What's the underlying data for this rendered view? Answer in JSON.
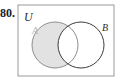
{
  "figure": {
    "problem_number": "80.",
    "type": "venn-diagram",
    "universe_label": "U",
    "set_a_label": "A",
    "set_b_label": "B",
    "shaded_region": "A minus B",
    "colors": {
      "shading_fill": "#e2e2e2",
      "circle_a_stroke": "#8c8c8c",
      "circle_b_stroke": "#3d3d3d",
      "rect_stroke": "#9a9a9a",
      "label_u_color": "#2b2b2b",
      "label_a_color": "#b5b5b5",
      "label_b_color": "#2b2b2b",
      "number_color": "#1a1a1a",
      "background": "#ffffff"
    },
    "geometry": {
      "rect": {
        "x": 1,
        "y": 1,
        "width": 96,
        "height": 71
      },
      "circle_a": {
        "cx": 38,
        "cy": 41,
        "r": 23
      },
      "circle_b": {
        "cx": 64,
        "cy": 41,
        "r": 23
      }
    }
  }
}
